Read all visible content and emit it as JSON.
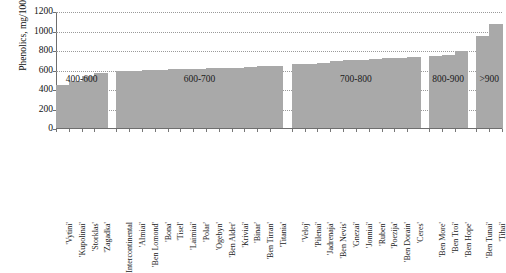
{
  "chart_data": {
    "type": "bar",
    "title": "",
    "xlabel": "",
    "ylabel": "Phenolics, mg/100g",
    "ylim": [
      0,
      1200
    ],
    "yticks": [
      0,
      200,
      400,
      600,
      800,
      1000,
      1200
    ],
    "grid": true,
    "legend": "none",
    "orientation": "vertical",
    "bar_color": "#a9a9a9",
    "categories": [
      "'Vytini'",
      "'Kupolinai'",
      "'Storklas'",
      "'Zagadka'",
      "Intercontinental",
      "'Almiai'",
      "'Ben Lomond'",
      "'Bona'",
      "'Tisel'",
      "'Laimiai'",
      "'Polar'",
      "'Ogebyn'",
      "'Ben Alder'",
      "'Kriviai'",
      "'Binar'",
      "'Ben Tirran'",
      "'Titania'",
      "'Veloj'",
      "'Pilenai'",
      "'Jadrenaja'",
      "'Ben Nevis'",
      "'Gnezai'",
      "'Jonniai'",
      "'Ruben'",
      "'Poezija'",
      "'Ben Dorain'",
      "'Ceres'",
      "'Ben More'",
      "'Ben Troi'",
      "'Ben Hope'",
      "'Ben Tunai'",
      "'Tihai'"
    ],
    "values": [
      455,
      492,
      545,
      570,
      592,
      600,
      605,
      610,
      613,
      617,
      620,
      622,
      625,
      630,
      637,
      643,
      650,
      662,
      668,
      675,
      700,
      706,
      712,
      718,
      724,
      730,
      740,
      752,
      760,
      800,
      950,
      1080
    ],
    "groups": [
      {
        "label": "400-600",
        "start": 0,
        "count": 4
      },
      {
        "label": "600-700",
        "start": 4,
        "count": 13
      },
      {
        "label": "700-800",
        "start": 17,
        "count": 10
      },
      {
        "label": "800-900",
        "start": 27,
        "count": 3
      },
      {
        "label": ">900",
        "start": 30,
        "count": 2
      }
    ]
  }
}
